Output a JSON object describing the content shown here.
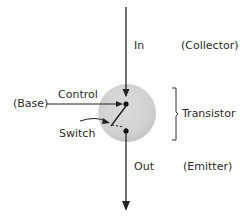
{
  "diagram": {
    "labels": {
      "in": "In",
      "collector": "(Collector)",
      "control": "Control",
      "base": "(Base)",
      "switch": "Switch",
      "transistor": "Transistor",
      "out": "Out",
      "emitter": "(Emitter)"
    },
    "colors": {
      "line": "#222222",
      "circle_fill": "#d4d4d4",
      "circle_shadow": "#bdbdbd",
      "text": "#2b2b2b"
    }
  }
}
